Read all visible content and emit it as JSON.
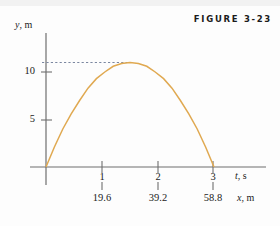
{
  "figure": {
    "label": "FIGURE 3-23",
    "curve_color": "#E0A951",
    "axis_color": "#6f6f6f",
    "dash_color": "#7b87a0",
    "text_color": "#1b1b1b",
    "background": "#fdfdfd"
  },
  "axes": {
    "y_axis_label": "y, m",
    "y_axis_label_var": "y",
    "y_axis_label_unit": ", m",
    "x_axis_label_primary": "t, s",
    "x_axis_label_primary_var": "t",
    "x_axis_label_primary_unit": ", s",
    "x_axis_label_secondary": "x, m",
    "x_axis_label_secondary_var": "x",
    "x_axis_label_secondary_unit": ", m",
    "y_ticks": [
      "5",
      "10"
    ],
    "x_ticks_time": [
      "1",
      "2",
      "3"
    ],
    "x_ticks_distance": [
      "19.6",
      "39.2",
      "58.8"
    ]
  },
  "chart_data": {
    "type": "line",
    "title": "FIGURE 3-23",
    "xlabel": "t, s",
    "ylabel": "y, m",
    "secondary_xlabel": "x, m",
    "xlim": [
      0,
      3.4
    ],
    "ylim": [
      0,
      12.5
    ],
    "grid": false,
    "legend": null,
    "x_tick_labels": [
      "1",
      "2",
      "3"
    ],
    "x_tick_values": [
      1,
      2,
      3
    ],
    "secondary_x_tick_labels": [
      "19.6",
      "39.2",
      "58.8"
    ],
    "secondary_x_tick_values": [
      19.6,
      39.2,
      58.8
    ],
    "y_tick_labels": [
      "5",
      "10"
    ],
    "y_tick_values": [
      5,
      10
    ],
    "annotations": [
      {
        "type": "dashed-horizontal-line",
        "y": 11.0,
        "x_from": 0,
        "x_to": 1.5,
        "color": "#7b87a0"
      }
    ],
    "series": [
      {
        "name": "projectile trajectory",
        "color": "#E0A951",
        "x": [
          0,
          0.15,
          0.3,
          0.45,
          0.6,
          0.75,
          0.9,
          1.05,
          1.2,
          1.35,
          1.5,
          1.65,
          1.8,
          1.95,
          2.1,
          2.25,
          2.4,
          2.55,
          2.7,
          2.85,
          3.0
        ],
        "y": [
          0,
          2.1,
          4.0,
          5.6,
          7.0,
          8.3,
          9.3,
          10.0,
          10.6,
          10.9,
          11.0,
          10.9,
          10.6,
          10.0,
          9.3,
          8.3,
          7.0,
          5.6,
          4.0,
          2.1,
          0
        ]
      }
    ]
  }
}
